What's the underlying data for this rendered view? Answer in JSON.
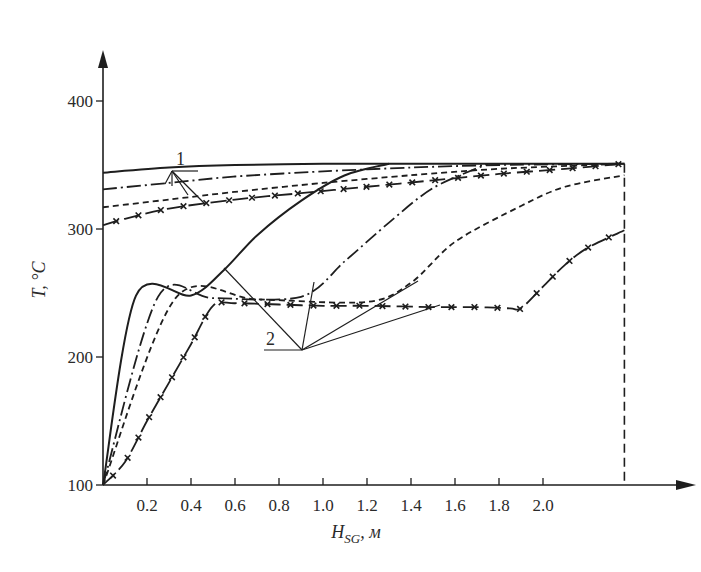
{
  "chart_data": {
    "type": "line",
    "title": "",
    "xlabel": "H_SG, м",
    "ylabel": "T, °C",
    "xlim": [
      0,
      2.37
    ],
    "ylim": [
      100,
      430
    ],
    "grid": false,
    "x_ticks": [
      0.2,
      0.4,
      0.6,
      0.8,
      1.0,
      1.2,
      1.4,
      1.6,
      1.8,
      2.0
    ],
    "x_tick_labels": [
      "0.2",
      "0.4",
      "0.6",
      "0.8",
      "1.0",
      "1.2",
      "1.4",
      "1.6",
      "1.8",
      "2.0"
    ],
    "y_ticks": [
      100,
      200,
      300,
      400
    ],
    "y_tick_labels": [
      "100",
      "200",
      "300",
      "400"
    ],
    "end_marker_x": 2.37,
    "end_marker_y": 351,
    "annotations": [
      {
        "label": "1",
        "meaning": "primary coolant temperature curves"
      },
      {
        "label": "2",
        "meaning": "secondary (working fluid) temperature curves"
      }
    ],
    "series": [
      {
        "name": "primary-solid",
        "style": "solid",
        "group": 1,
        "x": [
          0,
          0.3,
          0.6,
          1.0,
          1.4,
          1.8,
          2.37
        ],
        "y": [
          344,
          348,
          350,
          351,
          351,
          351,
          351
        ]
      },
      {
        "name": "primary-dashdot",
        "style": "dashdot",
        "group": 1,
        "x": [
          0,
          0.3,
          0.6,
          1.0,
          1.4,
          1.8,
          2.37
        ],
        "y": [
          331,
          336,
          341,
          345,
          348,
          350,
          351
        ]
      },
      {
        "name": "primary-dashed",
        "style": "dashed",
        "group": 1,
        "x": [
          0,
          0.3,
          0.6,
          1.0,
          1.4,
          1.8,
          2.37
        ],
        "y": [
          317,
          323,
          329,
          336,
          342,
          347,
          351
        ]
      },
      {
        "name": "primary-crossed",
        "style": "crossed",
        "group": 1,
        "x": [
          0,
          0.1,
          0.3,
          0.6,
          0.9,
          1.2,
          1.5,
          1.8,
          2.1,
          2.37
        ],
        "y": [
          303,
          308,
          316,
          323,
          328,
          333,
          338,
          343,
          347,
          351
        ]
      },
      {
        "name": "secondary-solid",
        "style": "solid",
        "group": 2,
        "x": [
          0,
          0.15,
          0.4,
          0.55,
          0.7,
          0.9,
          1.1,
          1.3
        ],
        "y": [
          100,
          248,
          248,
          268,
          295,
          322,
          342,
          351
        ]
      },
      {
        "name": "secondary-dashdot",
        "style": "dashdot",
        "group": 2,
        "x": [
          0,
          0.25,
          0.5,
          0.9,
          1.1,
          1.3,
          1.5,
          1.75
        ],
        "y": [
          100,
          247,
          246,
          247,
          275,
          305,
          332,
          351
        ]
      },
      {
        "name": "secondary-dashed",
        "style": "dashed",
        "group": 2,
        "x": [
          0,
          0.33,
          0.7,
          1.2,
          1.4,
          1.6,
          1.9,
          2.1,
          2.37
        ],
        "y": [
          100,
          246,
          245,
          243,
          258,
          290,
          318,
          333,
          342
        ]
      },
      {
        "name": "secondary-crossed",
        "style": "crossed",
        "group": 2,
        "x": [
          0,
          0.1,
          0.2,
          0.3,
          0.4,
          0.5,
          0.6,
          0.8,
          1.0,
          1.2,
          1.5,
          1.7,
          1.85,
          1.9,
          2.0,
          2.1,
          2.2,
          2.37
        ],
        "y": [
          100,
          118,
          150,
          180,
          210,
          240,
          242,
          241,
          240,
          240,
          239,
          239,
          238,
          238,
          255,
          272,
          285,
          299
        ]
      }
    ]
  }
}
